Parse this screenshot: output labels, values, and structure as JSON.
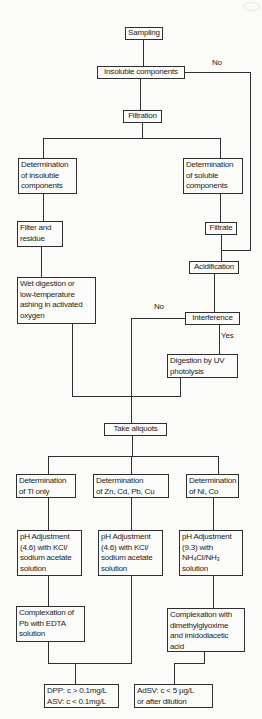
{
  "page": {
    "background": "#fbfbf9",
    "ink": "#2e2e2e"
  },
  "edge_labels": {
    "no_insoluble": "No",
    "no_interference": "No",
    "yes_interference": "Yes"
  },
  "nodes": {
    "sampling": {
      "label": "Sampling"
    },
    "insoluble_components": {
      "label": "Insoluble components"
    },
    "filtration": {
      "label": "Filtration"
    },
    "det_insoluble": {
      "lines": [
        "Determination",
        "of insoluble",
        "components"
      ]
    },
    "det_soluble": {
      "lines": [
        "Determination",
        "of soluble",
        "components"
      ]
    },
    "filter_residue": {
      "lines": [
        "Filter and",
        "residue"
      ]
    },
    "filtrate": {
      "label": "Filtrate"
    },
    "wet_digestion": {
      "lines": [
        "Wet digestion or",
        "low-temperature",
        "ashing in activated",
        "oxygen"
      ]
    },
    "acidification": {
      "label": "Acidification"
    },
    "interference": {
      "label": "Interference"
    },
    "digestion_uv": {
      "lines": [
        "Digestion by UV",
        "photolysis"
      ]
    },
    "take_aliquots": {
      "label": "Take aliquots"
    },
    "det_tl": {
      "lines": [
        "Determination",
        "of Tl only"
      ]
    },
    "det_zn_cd_pb_cu": {
      "lines": [
        "Determination",
        "of Zn, Cd, Pb, Cu"
      ]
    },
    "det_ni_co": {
      "lines": [
        "Determination",
        "of Ni, Co"
      ]
    },
    "ph_adjust_tl": {
      "lines": [
        "pH Adjustment",
        "(4.6) with KCl/",
        "sodium acetate",
        "solution"
      ]
    },
    "ph_adjust_zn": {
      "lines": [
        "pH Adjustment",
        "(4.6) with KCl/",
        "sodium acetate",
        "solution"
      ]
    },
    "ph_adjust_ni": {
      "lines": [
        "pH Adjustment",
        "(9.3) with",
        "NH₄Cl/NH₃",
        "solution"
      ]
    },
    "complex_edta": {
      "lines": [
        "Complexation of",
        "Pb with EDTA",
        "solution"
      ]
    },
    "complex_dmg": {
      "lines": [
        "Complexation with",
        "dimethylglyoxime",
        "and imidodiacetic",
        "acid"
      ]
    },
    "result_dpp_asv": {
      "lines": [
        "DPP: c > 0.1mg/L",
        "ASV: c < 0.1mg/L"
      ]
    },
    "result_adsv": {
      "lines": [
        "AdSV: c < 5 µg/L",
        "or after dilution"
      ]
    }
  }
}
